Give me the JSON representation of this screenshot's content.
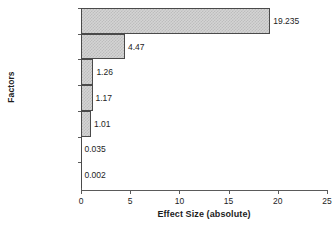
{
  "chart_data": {
    "type": "bar",
    "orientation": "horizontal",
    "title": "",
    "xlabel": "Effect Size (absolute)",
    "ylabel": "Factors",
    "categories": [
      "E-Cooling period",
      "A-Temp",
      "BC",
      "D-origin",
      "C-Seeds",
      "BE",
      "B-Antisolvent"
    ],
    "values": [
      19.235,
      4.47,
      1.26,
      1.17,
      1.01,
      0.035,
      0.002
    ],
    "value_labels": [
      "19.235",
      "4.47",
      "1.26",
      "1.17",
      "1.01",
      "0.035",
      "0.002"
    ],
    "xlim": [
      0,
      25
    ],
    "xticks": [
      0,
      5,
      10,
      15,
      20,
      25
    ],
    "xtick_labels": [
      "0",
      "5",
      "10",
      "15",
      "20",
      "25"
    ],
    "grid": false,
    "legend": null,
    "bar_fill_color": "#d4d4d4",
    "bar_edge_color": "#4a4a4a",
    "axis_color": "#5a5a5a",
    "text_color": "#1d1d1d"
  }
}
